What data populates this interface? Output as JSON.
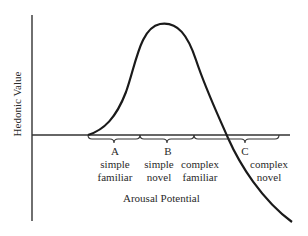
{
  "diagram": {
    "type": "wundt-curve",
    "y_axis_label": "Hedonic Value",
    "x_axis_label": "Arousal Potential",
    "regions": [
      {
        "letter": "A",
        "line1": "simple",
        "line2": "familiar"
      },
      {
        "letter": "B",
        "line1": "simple",
        "line2": "novel"
      },
      {
        "letter": "",
        "line1": "complex",
        "line2": "familiar"
      },
      {
        "letter": "C",
        "line1": "complex",
        "line2": "novel"
      }
    ],
    "colors": {
      "line": "#1a1a1a",
      "text": "#2a2a2a",
      "background": "#ffffff"
    }
  }
}
